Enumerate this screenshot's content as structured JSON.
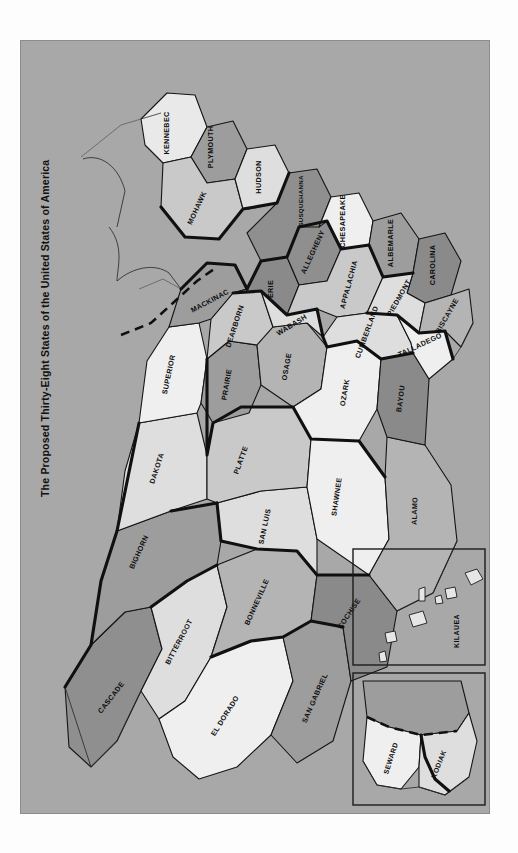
{
  "meta": {
    "title": "The Proposed Thirty-Eight States of the United States of America",
    "copyright": "Copyright ©1973 by Plycon Press, 1916 North Gilbert, Fullerton, Calif., 92633",
    "background_color": "#a8a8a8",
    "page_color": "#fdfdfd",
    "border_color": "#8c8c8c",
    "line_color": "#101010"
  },
  "palette": {
    "tone_lightest": "#efefef",
    "tone_light": "#dedede",
    "tone_midlight": "#c9c9c9",
    "tone_mid": "#b4b4b4",
    "tone_middark": "#9d9d9d",
    "tone_dark": "#858585",
    "tone_darkest": "#6f6f6f"
  },
  "states": [
    {
      "name": "KENNEBEC",
      "fill": "#e9e9e9",
      "region": "northeast"
    },
    {
      "name": "PLYMOUTH",
      "fill": "#9d9d9d",
      "region": "northeast"
    },
    {
      "name": "MOHAWK",
      "fill": "#c9c9c9",
      "region": "northeast"
    },
    {
      "name": "HUDSON",
      "fill": "#dedede",
      "region": "northeast"
    },
    {
      "name": "SUSQUEHANNA",
      "fill": "#8f8f8f",
      "region": "northeast"
    },
    {
      "name": "CHESAPEAKE",
      "fill": "#efefef",
      "region": "mid-atlantic"
    },
    {
      "name": "ALBEMARLE",
      "fill": "#9d9d9d",
      "region": "mid-atlantic"
    },
    {
      "name": "CAROLINA",
      "fill": "#8a8a8a",
      "region": "southeast"
    },
    {
      "name": "PIEDMONT",
      "fill": "#dedede",
      "region": "southeast"
    },
    {
      "name": "BISCAYNE",
      "fill": "#b4b4b4",
      "region": "southeast"
    },
    {
      "name": "TALLADEGO",
      "fill": "#efefef",
      "region": "southeast"
    },
    {
      "name": "APPALACHIA",
      "fill": "#c9c9c9",
      "region": "appalachian"
    },
    {
      "name": "CUMBERLAND",
      "fill": "#dedede",
      "region": "appalachian"
    },
    {
      "name": "ALLEGHENY",
      "fill": "#8f8f8f",
      "region": "appalachian"
    },
    {
      "name": "ERIE",
      "fill": "#8a8a8a",
      "region": "great-lakes"
    },
    {
      "name": "MACKINAC",
      "fill": "#9d9d9d",
      "region": "great-lakes"
    },
    {
      "name": "SUPERIOR",
      "fill": "#efefef",
      "region": "great-lakes"
    },
    {
      "name": "DEARBORN",
      "fill": "#c9c9c9",
      "region": "midwest"
    },
    {
      "name": "WABASH",
      "fill": "#dedede",
      "region": "midwest"
    },
    {
      "name": "OSAGE",
      "fill": "#b4b4b4",
      "region": "midwest"
    },
    {
      "name": "PRAIRIE",
      "fill": "#9d9d9d",
      "region": "midwest"
    },
    {
      "name": "OZARK",
      "fill": "#efefef",
      "region": "midwest"
    },
    {
      "name": "BAYOU",
      "fill": "#8a8a8a",
      "region": "south"
    },
    {
      "name": "SHAWNEE",
      "fill": "#efefef",
      "region": "plains"
    },
    {
      "name": "PLATTE",
      "fill": "#c9c9c9",
      "region": "plains"
    },
    {
      "name": "DAKOTA",
      "fill": "#dedede",
      "region": "plains"
    },
    {
      "name": "ALAMO",
      "fill": "#b4b4b4",
      "region": "south"
    },
    {
      "name": "BIGHORN",
      "fill": "#9d9d9d",
      "region": "mountain"
    },
    {
      "name": "BITTERROOT",
      "fill": "#dedede",
      "region": "mountain"
    },
    {
      "name": "CASCADE",
      "fill": "#8f8f8f",
      "region": "northwest"
    },
    {
      "name": "BONNEVILLE",
      "fill": "#b4b4b4",
      "region": "mountain"
    },
    {
      "name": "SAN LUIS",
      "fill": "#dedede",
      "region": "mountain"
    },
    {
      "name": "EL DORADO",
      "fill": "#efefef",
      "region": "southwest"
    },
    {
      "name": "SAN GABRIEL",
      "fill": "#9d9d9d",
      "region": "southwest"
    },
    {
      "name": "COCHISE",
      "fill": "#8a8a8a",
      "region": "southwest"
    },
    {
      "name": "SEWARD",
      "fill": "#efefef",
      "region": "alaska"
    },
    {
      "name": "KODIAK",
      "fill": "#dedede",
      "region": "alaska"
    },
    {
      "name": "KILAUEA",
      "fill": "#b4b4b4",
      "region": "hawaii"
    }
  ],
  "insets": [
    {
      "id": "hawaii",
      "label": "KILAUEA"
    },
    {
      "id": "alaska",
      "labels": [
        "SEWARD",
        "KODIAK"
      ]
    }
  ],
  "state_count": 38
}
